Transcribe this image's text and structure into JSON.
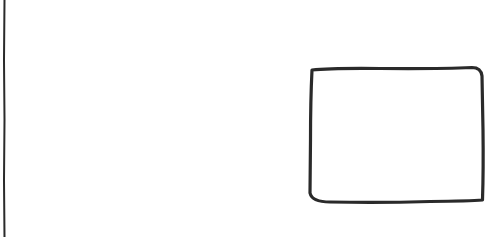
{
  "canvas": {
    "width": 503,
    "height": 237,
    "background": "#ffffff"
  },
  "stroke_color": "#2a2a2a",
  "shapes": [
    {
      "type": "vertical-line",
      "x": 4,
      "y1": 0,
      "y2": 237
    },
    {
      "type": "hand-drawn-rectangle",
      "x": 310,
      "y": 68,
      "width": 174,
      "height": 135
    }
  ]
}
